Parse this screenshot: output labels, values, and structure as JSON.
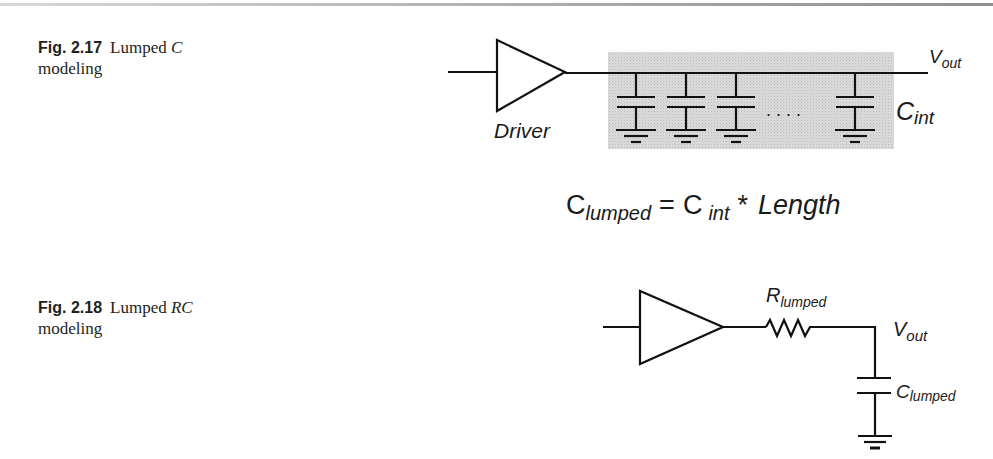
{
  "page": {
    "top_rule": true
  },
  "figures": [
    {
      "id": "fig-2-17",
      "number_label": "Fig. 2.17",
      "caption_prefix": "Lumped ",
      "caption_italic": "C",
      "caption_suffix": " modeling",
      "diagram": {
        "driver_label": "Driver",
        "output_label_main": "V",
        "output_label_sub": "out",
        "cap_label_main": "C",
        "cap_label_sub": "int",
        "capacitor_count_shown": 4,
        "ellipsis": ". . . .",
        "shaded_region_color": "#d4d4d4"
      },
      "equation": {
        "lhs_main": "C",
        "lhs_sub": "lumped",
        "equals": "=",
        "rhs_main": "C",
        "rhs_sub": "int",
        "operator": "*",
        "rhs_factor": "Length"
      }
    },
    {
      "id": "fig-2-18",
      "number_label": "Fig. 2.18",
      "caption_prefix": "Lumped ",
      "caption_italic": "RC",
      "caption_suffix": " modeling",
      "diagram": {
        "resistor_label_main": "R",
        "resistor_label_sub": "lumped",
        "output_label_main": "V",
        "output_label_sub": "out",
        "cap_label_main": "C",
        "cap_label_sub": "lumped"
      }
    }
  ]
}
